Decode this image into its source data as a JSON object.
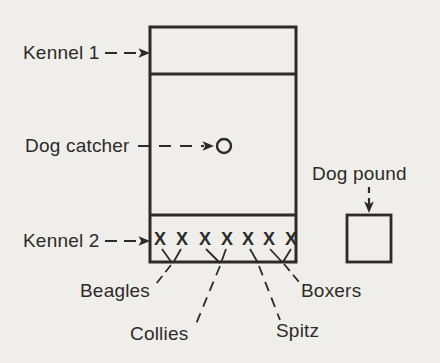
{
  "figure": {
    "colors": {
      "background": "#f0eeea",
      "ink": "#2d2b28"
    },
    "labels": {
      "kennel1": "Kennel 1",
      "dog_catcher": "Dog catcher",
      "kennel2": "Kennel 2",
      "dog_pound": "Dog pound",
      "beagles": "Beagles",
      "collies": "Collies",
      "spitz": "Spitz",
      "boxers": "Boxers"
    },
    "kennel2_marks": [
      "X",
      "X",
      "X",
      "X",
      "X",
      "X",
      "X"
    ],
    "mark_groups": {
      "beagles": [
        1,
        2
      ],
      "collies": [
        3,
        4
      ],
      "spitz": [
        5
      ],
      "boxers": [
        6,
        7
      ]
    }
  }
}
